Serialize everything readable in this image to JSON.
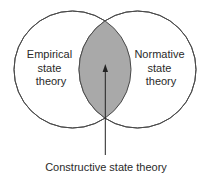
{
  "diagram": {
    "type": "venn",
    "sets": [
      {
        "id": "empirical",
        "label_lines": [
          "Empirical",
          "state",
          "theory"
        ]
      },
      {
        "id": "normative",
        "label_lines": [
          "Normative",
          "state",
          "theory"
        ]
      }
    ],
    "intersection": {
      "label": "Constructive state theory",
      "fill": "#a9a9a9"
    },
    "colors": {
      "stroke": "#4a4a4a",
      "circle_fill": "#ffffff",
      "text": "#2a2a2a"
    }
  }
}
